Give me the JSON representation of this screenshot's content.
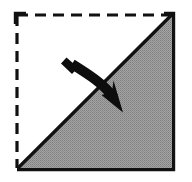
{
  "figure": {
    "description": "Square sheet folded along the diagonal; upper-left half shown dashed, lower-right half shaded gray, curved arrow indicates fold direction toward lower right.",
    "background_color": "#ffffff"
  },
  "canvas": {
    "width": 192,
    "height": 182
  },
  "square": {
    "label": "paper-square",
    "left": 17,
    "top": 15,
    "right": 172,
    "bottom": 168,
    "stroke_color": "#111111",
    "stroke_width": 3.2,
    "edges": [
      {
        "name": "top-edge",
        "style": "dashed",
        "from": [
          17,
          15
        ],
        "to": [
          172,
          15
        ]
      },
      {
        "name": "right-edge",
        "style": "solid",
        "from": [
          172,
          15
        ],
        "to": [
          172,
          168
        ]
      },
      {
        "name": "bottom-edge",
        "style": "solid",
        "from": [
          172,
          168
        ],
        "to": [
          17,
          168
        ]
      },
      {
        "name": "left-edge",
        "style": "dashed",
        "from": [
          17,
          168
        ],
        "to": [
          17,
          15
        ]
      }
    ],
    "dash_pattern": "11 7"
  },
  "diagonal": {
    "label": "fold-line",
    "style": "solid",
    "from": [
      17,
      168
    ],
    "to": [
      172,
      15
    ],
    "stroke_color": "#111111",
    "stroke_width": 3.2
  },
  "shaded_triangle": {
    "label": "folded-half",
    "points": "17,168 172,168 172,15",
    "fill_color": "#9a9a9a",
    "fill_texture": "halftone-dither",
    "position": "lower-right"
  },
  "unshaded_triangle": {
    "label": "unfolded-half",
    "points": "17,168 17,15 172,15",
    "fill_color": "#ffffff",
    "position": "upper-left"
  },
  "fold_arrow": {
    "label": "fold-direction-arrow",
    "color": "#0d0d0d",
    "direction": "down-right",
    "tail": [
      70,
      62
    ],
    "tip": [
      123,
      111
    ],
    "curved": true,
    "crosses": "fold-line"
  },
  "colors": {
    "ink": "#111111",
    "shade": "#9a9a9a",
    "paper": "#ffffff"
  }
}
